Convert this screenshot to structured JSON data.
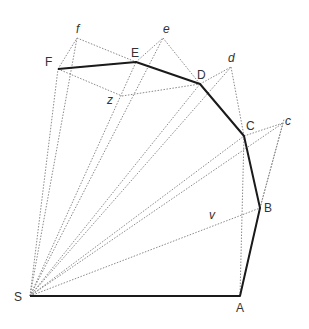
{
  "diagram": {
    "title": "",
    "polygon_vertices": [
      "S",
      "A",
      "B",
      "C",
      "D",
      "E",
      "F"
    ],
    "auxiliary_points": [
      "f",
      "e",
      "d",
      "c",
      "z",
      "v"
    ],
    "labels": {
      "S": "S",
      "A": "A",
      "B": "B",
      "C": "C",
      "D": "D",
      "E": "E",
      "F": "F",
      "f": "f",
      "e": "e",
      "d": "d",
      "c": "c",
      "z": "z",
      "v": "v"
    },
    "solid_path": [
      "S",
      "A",
      "B",
      "C",
      "D",
      "E",
      "F"
    ],
    "dotted_rays_from_S": [
      "B",
      "c",
      "C",
      "d",
      "D",
      "e",
      "E",
      "f",
      "F"
    ],
    "dotted_segments": [
      [
        "F",
        "f"
      ],
      [
        "f",
        "E"
      ],
      [
        "E",
        "e"
      ],
      [
        "e",
        "D"
      ],
      [
        "D",
        "d"
      ],
      [
        "d",
        "C"
      ],
      [
        "C",
        "c"
      ],
      [
        "c",
        "B"
      ],
      [
        "B",
        "A"
      ],
      [
        "F",
        "z"
      ],
      [
        "z",
        "D"
      ],
      [
        "A",
        "C"
      ]
    ],
    "line_styles": {
      "solid_color": "#1a1a1a",
      "dotted_color": "#8a8a8a"
    }
  }
}
